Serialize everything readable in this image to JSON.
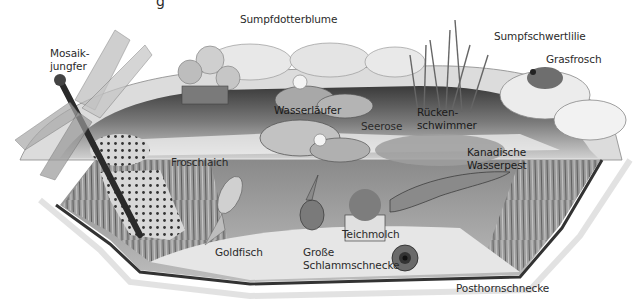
{
  "title_fragment": "g",
  "labels": [
    {
      "id": "mosaikjungfer",
      "text": "Mosaik-\njungfer",
      "x": 50,
      "y": 47
    },
    {
      "id": "sumpfdotterblume",
      "text": "Sumpfdotterblume",
      "x": 240,
      "y": 13
    },
    {
      "id": "sumpfschwertlilie",
      "text": "Sumpfschwertlilie",
      "x": 494,
      "y": 30
    },
    {
      "id": "grasfrosch",
      "text": "Grasfrosch",
      "x": 546,
      "y": 53
    },
    {
      "id": "wasserlaeufer",
      "text": "Wasserläufer",
      "x": 274,
      "y": 104
    },
    {
      "id": "seerose",
      "text": "Seerose",
      "x": 361,
      "y": 120
    },
    {
      "id": "rueckenschwimmer",
      "text": "Rücken-\nschwimmer",
      "x": 417,
      "y": 106
    },
    {
      "id": "froschlaich",
      "text": "Froschlaich",
      "x": 171,
      "y": 156
    },
    {
      "id": "kanadische-wasserpest",
      "text": "Kanadische\nWasserpest",
      "x": 467,
      "y": 146
    },
    {
      "id": "goldfisch",
      "text": "Goldfisch",
      "x": 215,
      "y": 246
    },
    {
      "id": "teichmolch",
      "text": "Teichmolch",
      "x": 342,
      "y": 228
    },
    {
      "id": "grosse-schlammschnecke",
      "text": "Große\nSchlammschnecke",
      "x": 303,
      "y": 246
    },
    {
      "id": "posthornschnecke",
      "text": "Posthornschnecke",
      "x": 456,
      "y": 282
    }
  ],
  "colors": {
    "background": "#ffffff",
    "text": "#2a2a2a",
    "water_dark": "#2b2b2b",
    "water_mid": "#6b6b6b",
    "rock": "#d9d9d9",
    "sand": "#e6e6e6",
    "liner": "#333333"
  }
}
